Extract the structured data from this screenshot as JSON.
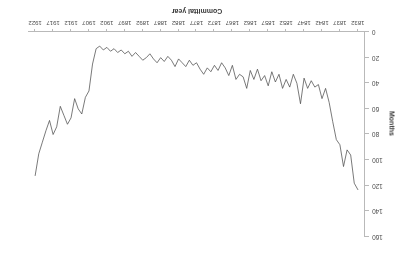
{
  "figure": {
    "rotation_degrees": 180,
    "background_color": "#ffffff",
    "line_color": "#4d4d4d",
    "axis_color": "#b9b9b9"
  },
  "chart_data": {
    "type": "line",
    "title": "",
    "xlabel": "Committal year",
    "ylabel": "Months",
    "grid": false,
    "legend": "none",
    "y_inverted": true,
    "xlim": [
      1830,
      1924
    ],
    "ylim": [
      0,
      160
    ],
    "xticks": [
      1832,
      1837,
      1842,
      1847,
      1852,
      1857,
      1862,
      1867,
      1872,
      1877,
      1882,
      1887,
      1892,
      1897,
      1902,
      1907,
      1912,
      1917,
      1922
    ],
    "yticks": [
      0,
      20,
      40,
      60,
      80,
      100,
      120,
      140,
      160
    ],
    "series": [
      {
        "name": "Mean sentence length",
        "x": [
          1832,
          1833,
          1834,
          1835,
          1836,
          1837,
          1838,
          1839,
          1840,
          1841,
          1842,
          1843,
          1844,
          1845,
          1846,
          1847,
          1848,
          1849,
          1850,
          1851,
          1852,
          1853,
          1854,
          1855,
          1856,
          1857,
          1858,
          1859,
          1860,
          1861,
          1862,
          1863,
          1864,
          1865,
          1866,
          1867,
          1868,
          1869,
          1870,
          1871,
          1872,
          1873,
          1874,
          1875,
          1876,
          1877,
          1878,
          1879,
          1880,
          1881,
          1882,
          1883,
          1884,
          1885,
          1886,
          1887,
          1888,
          1889,
          1890,
          1891,
          1892,
          1893,
          1894,
          1895,
          1896,
          1897,
          1898,
          1899,
          1900,
          1901,
          1902,
          1903,
          1904,
          1905,
          1906,
          1907,
          1908,
          1909,
          1910,
          1911,
          1912,
          1913,
          1914,
          1915,
          1916,
          1917,
          1918,
          1919,
          1920,
          1921,
          1922
        ],
        "y": [
          123.0,
          118.0,
          96.0,
          92.0,
          105.0,
          88.0,
          84.0,
          70.0,
          55.0,
          44.0,
          52.0,
          41.0,
          43.0,
          38.0,
          44.0,
          36.0,
          56.0,
          40.0,
          33.0,
          43.0,
          37.0,
          44.0,
          33.0,
          39.0,
          31.0,
          42.0,
          34.0,
          38.0,
          29.0,
          37.0,
          30.0,
          44.0,
          35.0,
          33.0,
          37.0,
          26.0,
          34.0,
          28.0,
          24.0,
          30.0,
          26.0,
          31.0,
          28.0,
          33.0,
          29.0,
          24.0,
          26.0,
          22.0,
          27.0,
          24.0,
          21.0,
          27.0,
          22.0,
          19.0,
          23.0,
          20.0,
          24.0,
          21.0,
          17.0,
          20.0,
          22.0,
          19.0,
          16.0,
          19.0,
          15.0,
          17.0,
          14.0,
          16.0,
          13.0,
          15.0,
          12.0,
          14.0,
          11.0,
          13.0,
          25.0,
          46.0,
          51.0,
          64.0,
          60.0,
          52.0,
          67.0,
          72.0,
          65.0,
          58.0,
          74.0,
          80.0,
          69.0,
          77.0,
          86.0,
          95.0,
          112.0
        ]
      }
    ]
  },
  "axes": {
    "x_title": "Committal year",
    "y_title": "Months"
  }
}
